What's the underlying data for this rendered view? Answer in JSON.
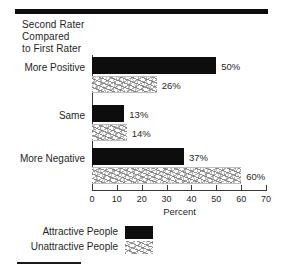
{
  "figure": {
    "title_lines": [
      "Second Rater",
      "Compared",
      "to First Rater"
    ],
    "top_rule": "decorative-top-rule",
    "bottom_rule": "decorative-bottom-rule"
  },
  "chart_data": {
    "type": "bar",
    "orientation": "horizontal",
    "title": "Second Rater Compared to First Rater",
    "xlabel": "Percent",
    "ylabel": "",
    "xlim": [
      0,
      70
    ],
    "xticks": [
      0,
      10,
      20,
      30,
      40,
      50,
      60,
      70
    ],
    "xticklabels": [
      "0",
      "10",
      "20",
      "30",
      "40",
      "50",
      "60",
      "70"
    ],
    "grid": false,
    "legend_position": "below-axes-left",
    "categories": [
      "More Positive",
      "Same",
      "More Negative"
    ],
    "series": [
      {
        "name": "Attractive People",
        "fill": "solid-black",
        "color": "#0d0d0d",
        "values": [
          50,
          13,
          37
        ],
        "labels": [
          "50%",
          "13%",
          "37%"
        ]
      },
      {
        "name": "Unattractive People",
        "fill": "hatched-gray",
        "color": "#b0b0b0",
        "values": [
          26,
          14,
          60
        ],
        "labels": [
          "26%",
          "14%",
          "60%"
        ]
      }
    ]
  },
  "legend": {
    "items": [
      {
        "label": "Attractive People",
        "swatch": "solid-black"
      },
      {
        "label": "Unattractive People",
        "swatch": "hatched-gray"
      }
    ]
  }
}
